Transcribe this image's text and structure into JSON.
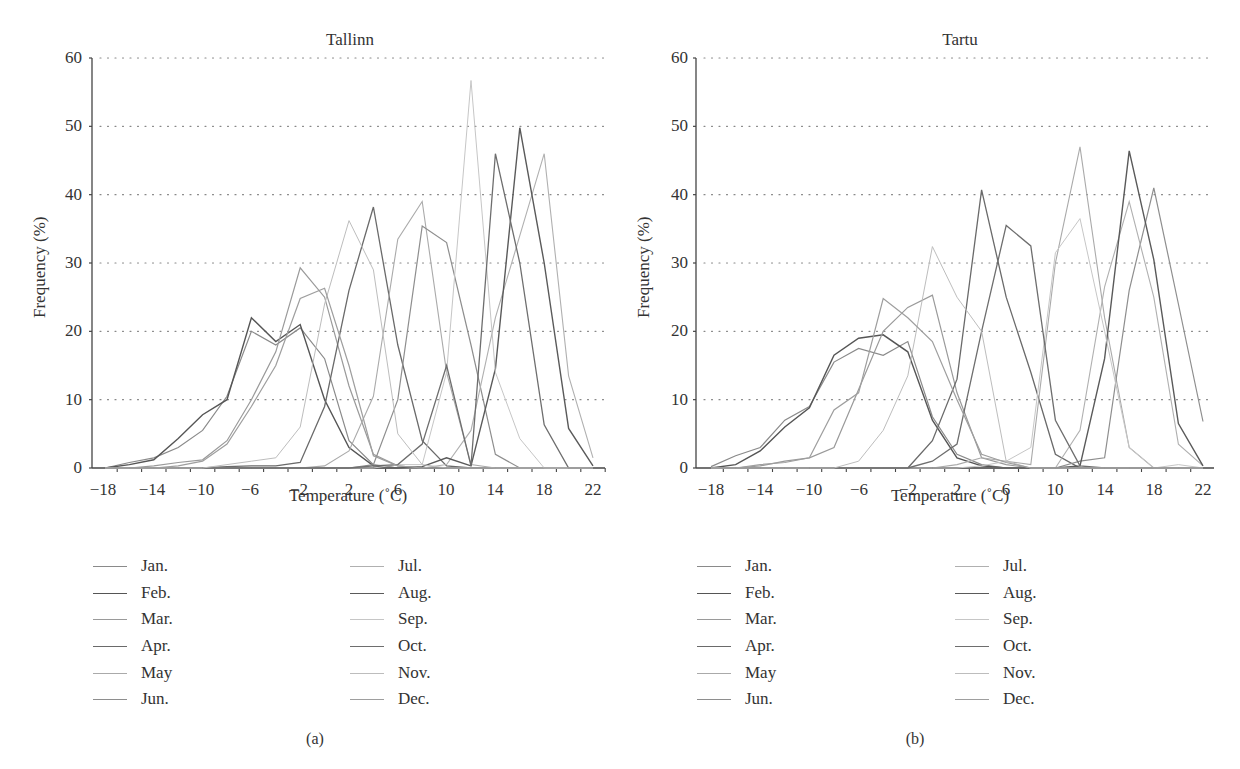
{
  "chart_data": [
    {
      "type": "line",
      "panel_label": "(a)",
      "title": "Tallinn",
      "xlabel": "Temperature (˚C)",
      "ylabel": "Frequency (%)",
      "xlim": [
        -19,
        23
      ],
      "ylim": [
        0,
        60
      ],
      "xticks": [
        -18,
        -14,
        -10,
        -6,
        -2,
        2,
        6,
        10,
        14,
        18,
        22
      ],
      "yticks": [
        0,
        10,
        20,
        30,
        40,
        50,
        60
      ],
      "grid": "horizontal dotted",
      "legend_position": "below, two columns",
      "x": [
        -18,
        -16,
        -14,
        -12,
        -10,
        -8,
        -6,
        -4,
        -2,
        0,
        2,
        4,
        6,
        8,
        10,
        12,
        14,
        16,
        18,
        20,
        22
      ],
      "series": [
        {
          "name": "Jan.",
          "color": "#8a8a8a",
          "width": 1.2,
          "values": [
            0,
            0.8,
            1.5,
            3,
            5.5,
            10.5,
            20,
            18,
            20.5,
            16,
            4,
            0.5,
            0,
            0,
            0,
            0,
            0,
            0,
            0,
            0,
            0
          ]
        },
        {
          "name": "Feb.",
          "color": "#555555",
          "width": 1.4,
          "values": [
            0,
            0.5,
            1.2,
            4.3,
            7.8,
            10,
            22,
            18.5,
            21,
            10,
            3,
            0.3,
            0,
            0,
            0,
            0,
            0,
            0,
            0,
            0,
            0
          ]
        },
        {
          "name": "Mar.",
          "color": "#9a9a9a",
          "width": 1.2,
          "values": [
            0,
            0,
            0.3,
            0.8,
            1.2,
            4,
            10,
            17,
            29.3,
            25,
            12,
            2,
            0.3,
            0,
            0,
            0,
            0,
            0,
            0,
            0,
            0
          ]
        },
        {
          "name": "Apr.",
          "color": "#6a6a6a",
          "width": 1.3,
          "values": [
            0,
            0,
            0,
            0,
            0,
            0.2,
            0.3,
            0.3,
            0.8,
            9,
            26,
            38.2,
            18,
            4,
            0.3,
            0,
            0,
            0,
            0,
            0,
            0
          ]
        },
        {
          "name": "May",
          "color": "#aaaaaa",
          "width": 1.1,
          "values": [
            0,
            0,
            0,
            0,
            0,
            0,
            0,
            0,
            0,
            0.3,
            2.5,
            10.5,
            33.5,
            39,
            14,
            0.5,
            0,
            0,
            0,
            0,
            0
          ]
        },
        {
          "name": "Jun.",
          "color": "#8e8e8e",
          "width": 1.2,
          "values": [
            0,
            0,
            0,
            0,
            0,
            0,
            0,
            0,
            0,
            0,
            0,
            0.5,
            10,
            35.4,
            33,
            18,
            2,
            0,
            0,
            0,
            0
          ]
        },
        {
          "name": "Jul.",
          "color": "#b0b0b0",
          "width": 1.1,
          "values": [
            0,
            0,
            0,
            0,
            0,
            0,
            0,
            0,
            0,
            0,
            0,
            0,
            0,
            0,
            0.5,
            5.5,
            22,
            34,
            46,
            13.5,
            1.5
          ]
        },
        {
          "name": "Aug.",
          "color": "#5a5a5a",
          "width": 1.4,
          "values": [
            0,
            0,
            0,
            0,
            0,
            0,
            0,
            0,
            0,
            0,
            0,
            0,
            0,
            0.2,
            1.5,
            0.3,
            14.5,
            49.8,
            30,
            5.8,
            0.3
          ]
        },
        {
          "name": "Sep.",
          "color": "#c6c6c6",
          "width": 1.0,
          "values": [
            0,
            0,
            0,
            0,
            0,
            0,
            0,
            0,
            0,
            0,
            0,
            0,
            0.5,
            0.5,
            14,
            56.7,
            14,
            4.3,
            0,
            0,
            0
          ]
        },
        {
          "name": "Oct.",
          "color": "#6e6e6e",
          "width": 1.3,
          "values": [
            0,
            0,
            0,
            0,
            0,
            0,
            0,
            0,
            0,
            0,
            0,
            0.3,
            0.5,
            3.5,
            15,
            0.3,
            46,
            30,
            6.3,
            0,
            0
          ]
        },
        {
          "name": "Nov.",
          "color": "#bdbdbd",
          "width": 1.0,
          "values": [
            0,
            0,
            0,
            0,
            0,
            0.5,
            1,
            1.5,
            6,
            24,
            36.2,
            29,
            5,
            0.5,
            0,
            0,
            0,
            0,
            0,
            0,
            0
          ]
        },
        {
          "name": "Dec.",
          "color": "#9e9e9e",
          "width": 1.2,
          "values": [
            0,
            0,
            0,
            0.3,
            1,
            3.5,
            9,
            15,
            24.8,
            26.3,
            15,
            1.8,
            0.3,
            0,
            0,
            0,
            0,
            0,
            0,
            0,
            0
          ]
        }
      ]
    },
    {
      "type": "line",
      "panel_label": "(b)",
      "title": "Tartu",
      "xlabel": "Temperature (˚C)",
      "ylabel": "Frequency (%)",
      "xlim": [
        -19,
        23
      ],
      "ylim": [
        0,
        60
      ],
      "xticks": [
        -18,
        -14,
        -10,
        -6,
        -2,
        2,
        6,
        10,
        14,
        18,
        22
      ],
      "yticks": [
        0,
        10,
        20,
        30,
        40,
        50,
        60
      ],
      "grid": "horizontal dotted",
      "legend_position": "below, two columns",
      "x": [
        -18,
        -16,
        -14,
        -12,
        -10,
        -8,
        -6,
        -4,
        -2,
        0,
        2,
        4,
        6,
        8,
        10,
        12,
        14,
        16,
        18,
        20,
        22
      ],
      "series": [
        {
          "name": "Jan.",
          "color": "#8a8a8a",
          "width": 1.2,
          "values": [
            0.2,
            1.8,
            3,
            7,
            9,
            15.5,
            17.5,
            16.5,
            18.5,
            7.5,
            2,
            0.5,
            0,
            0,
            0,
            0,
            0,
            0,
            0,
            0,
            0
          ]
        },
        {
          "name": "Feb.",
          "color": "#555555",
          "width": 1.4,
          "values": [
            0,
            0.5,
            2.5,
            6,
            8.8,
            16.5,
            19,
            19.5,
            17,
            7,
            1.5,
            0.3,
            0,
            0,
            0,
            0,
            0,
            0,
            0,
            0,
            0
          ]
        },
        {
          "name": "Mar.",
          "color": "#9a9a9a",
          "width": 1.2,
          "values": [
            0,
            0,
            0.3,
            1,
            1.5,
            3,
            11.5,
            20,
            23.5,
            25.3,
            11,
            1.5,
            0.5,
            0,
            0,
            0,
            0,
            0,
            0,
            0,
            0
          ]
        },
        {
          "name": "Apr.",
          "color": "#6a6a6a",
          "width": 1.3,
          "values": [
            0,
            0,
            0,
            0,
            0,
            0,
            0,
            0,
            0,
            4,
            13,
            40.7,
            25,
            14,
            2,
            0,
            0,
            0,
            0,
            0,
            0
          ]
        },
        {
          "name": "May",
          "color": "#aaaaaa",
          "width": 1.1,
          "values": [
            0,
            0,
            0,
            0,
            0,
            0,
            0,
            0,
            0,
            0,
            0.5,
            1.5,
            1,
            0.5,
            30,
            47,
            22,
            3,
            0,
            0,
            0
          ]
        },
        {
          "name": "Jun.",
          "color": "#8e8e8e",
          "width": 1.2,
          "values": [
            0,
            0,
            0,
            0,
            0,
            0,
            0,
            0,
            0,
            0,
            0,
            0,
            0,
            0,
            0,
            1,
            1.5,
            26,
            41,
            24,
            6.8
          ]
        },
        {
          "name": "Jul.",
          "color": "#b0b0b0",
          "width": 1.1,
          "values": [
            0,
            0,
            0,
            0,
            0,
            0,
            0,
            0,
            0,
            0,
            0,
            0,
            0,
            0,
            0,
            5.5,
            26.5,
            39,
            25,
            3.5,
            0.3
          ]
        },
        {
          "name": "Aug.",
          "color": "#5a5a5a",
          "width": 1.4,
          "values": [
            0,
            0,
            0,
            0,
            0,
            0,
            0,
            0,
            0,
            0,
            0,
            0,
            0,
            0,
            0,
            0.3,
            16,
            46.4,
            30.5,
            6.5,
            0.3
          ]
        },
        {
          "name": "Sep.",
          "color": "#c6c6c6",
          "width": 1.0,
          "values": [
            0,
            0,
            0,
            0,
            0,
            0,
            0,
            0,
            0,
            0,
            0,
            0.3,
            1,
            3,
            31.5,
            36.5,
            20,
            3,
            0,
            0.5,
            0
          ]
        },
        {
          "name": "Oct.",
          "color": "#6e6e6e",
          "width": 1.3,
          "values": [
            0,
            0,
            0,
            0,
            0,
            0,
            0,
            0,
            0,
            1,
            3.5,
            20,
            35.5,
            32.5,
            7,
            0.3,
            0,
            0,
            0,
            0,
            0
          ]
        },
        {
          "name": "Nov.",
          "color": "#bdbdbd",
          "width": 1.0,
          "values": [
            0,
            0,
            0,
            0,
            0,
            0,
            1,
            5.5,
            13.5,
            32.4,
            25,
            20,
            1,
            0,
            0,
            0,
            0,
            0,
            0,
            0,
            0
          ]
        },
        {
          "name": "Dec.",
          "color": "#9e9e9e",
          "width": 1.2,
          "values": [
            0,
            0,
            0.5,
            0.8,
            1.5,
            8.5,
            11,
            24.8,
            22,
            18.5,
            10,
            2,
            0.8,
            0,
            0,
            0,
            0,
            0,
            0,
            0,
            0
          ]
        }
      ]
    }
  ],
  "panels": [
    {
      "title": "Tallinn",
      "sub_label": "(a)",
      "xlabel": "Temperature (˚C)",
      "ylabel": "Frequency (%)",
      "xtick_labels": [
        "−18",
        "−14",
        "−10",
        "−6",
        "−2",
        "2",
        "6",
        "10",
        "14",
        "18",
        "22"
      ],
      "ytick_labels": [
        "0",
        "10",
        "20",
        "30",
        "40",
        "50",
        "60"
      ],
      "legend": [
        "Jan.",
        "Feb.",
        "Mar.",
        "Apr.",
        "May",
        "Jun.",
        "Jul.",
        "Aug.",
        "Sep.",
        "Oct.",
        "Nov.",
        "Dec."
      ]
    },
    {
      "title": "Tartu",
      "sub_label": "(b)",
      "xlabel": "Temperature (˚C)",
      "ylabel": "Frequency (%)",
      "xtick_labels": [
        "−18",
        "−14",
        "−10",
        "−6",
        "−2",
        "2",
        "6",
        "10",
        "14",
        "18",
        "22"
      ],
      "ytick_labels": [
        "0",
        "10",
        "20",
        "30",
        "40",
        "50",
        "60"
      ],
      "legend": [
        "Jan.",
        "Feb.",
        "Mar.",
        "Apr.",
        "May",
        "Jun.",
        "Jul.",
        "Aug.",
        "Sep.",
        "Oct.",
        "Nov.",
        "Dec."
      ]
    }
  ]
}
